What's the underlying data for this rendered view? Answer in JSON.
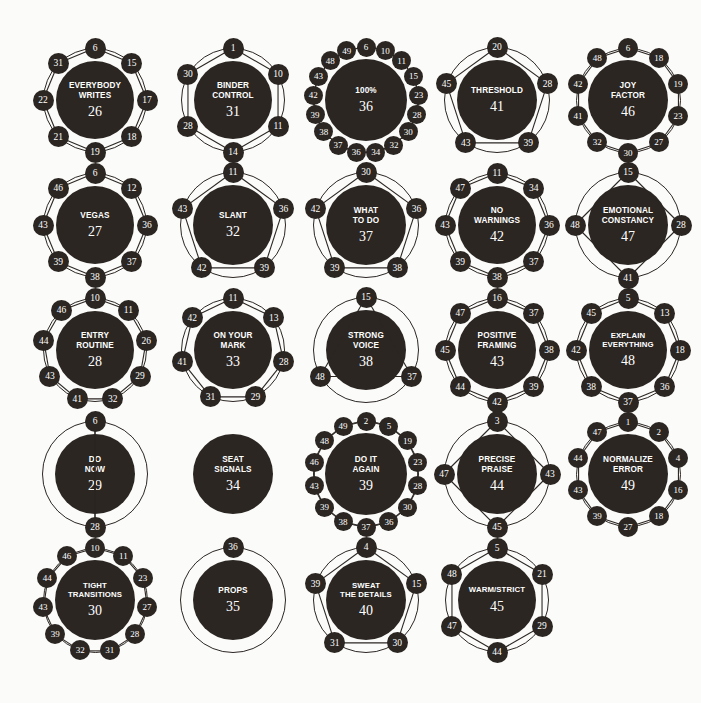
{
  "meta": {
    "hub_color": "#2b2622",
    "text_color": "#ffffff",
    "background_color": "#fbfbfa"
  },
  "chart_data": {
    "type": "diagram",
    "layout": {
      "columns": 5,
      "rows": 5,
      "grid": "left-to-right, top-to-bottom"
    },
    "nodes": [
      {
        "label": "EVERYBODY\nWRITES",
        "number": "26",
        "row": 1,
        "col": 1,
        "satellites": [
          "6",
          "15",
          "17",
          "18",
          "19",
          "21",
          "22",
          "31"
        ]
      },
      {
        "label": "BINDER\nCONTROL",
        "number": "31",
        "row": 1,
        "col": 2,
        "satellites": [
          "1",
          "10",
          "11",
          "14",
          "28",
          "30"
        ]
      },
      {
        "label": "100%",
        "number": "36",
        "row": 1,
        "col": 3,
        "satellites": [
          "6",
          "10",
          "11",
          "15",
          "23",
          "28",
          "30",
          "32",
          "34",
          "36",
          "37",
          "38",
          "39",
          "42",
          "43",
          "48",
          "49"
        ]
      },
      {
        "label": "THRESHOLD",
        "number": "41",
        "row": 1,
        "col": 4,
        "satellites": [
          "20",
          "28",
          "39",
          "43",
          "45"
        ]
      },
      {
        "label": "JOY\nFACTOR",
        "number": "46",
        "row": 1,
        "col": 5,
        "satellites": [
          "6",
          "18",
          "19",
          "23",
          "27",
          "30",
          "32",
          "41",
          "42",
          "48"
        ]
      },
      {
        "label": "VEGAS",
        "number": "27",
        "row": 2,
        "col": 1,
        "satellites": [
          "6",
          "12",
          "36",
          "37",
          "38",
          "39",
          "43",
          "46"
        ]
      },
      {
        "label": "SLANT",
        "number": "32",
        "row": 2,
        "col": 2,
        "satellites": [
          "11",
          "36",
          "39",
          "42",
          "43"
        ]
      },
      {
        "label": "WHAT\nTO DO",
        "number": "37",
        "row": 2,
        "col": 3,
        "satellites": [
          "30",
          "36",
          "38",
          "39",
          "42"
        ]
      },
      {
        "label": "NO\nWARNINGS",
        "number": "42",
        "row": 2,
        "col": 4,
        "satellites": [
          "11",
          "34",
          "36",
          "37",
          "38",
          "39",
          "43",
          "47"
        ]
      },
      {
        "label": "EMOTIONAL\nCONSTANCY",
        "number": "47",
        "row": 2,
        "col": 5,
        "satellites": [
          "15",
          "28",
          "41",
          "48"
        ]
      },
      {
        "label": "ENTRY\nROUTINE",
        "number": "28",
        "row": 3,
        "col": 1,
        "satellites": [
          "10",
          "11",
          "26",
          "29",
          "32",
          "41",
          "43",
          "44",
          "46"
        ]
      },
      {
        "label": "ON YOUR\nMARK",
        "number": "33",
        "row": 3,
        "col": 2,
        "satellites": [
          "11",
          "13",
          "28",
          "29",
          "31",
          "41",
          "42"
        ]
      },
      {
        "label": "STRONG\nVOICE",
        "number": "38",
        "row": 3,
        "col": 3,
        "satellites": [
          "15",
          "37",
          "48"
        ]
      },
      {
        "label": "POSITIVE\nFRAMING",
        "number": "43",
        "row": 3,
        "col": 4,
        "satellites": [
          "16",
          "37",
          "38",
          "39",
          "42",
          "44",
          "45",
          "47"
        ]
      },
      {
        "label": "EXPLAIN\nEVERYTHING",
        "number": "48",
        "row": 3,
        "col": 5,
        "satellites": [
          "5",
          "13",
          "18",
          "36",
          "37",
          "38",
          "42",
          "45"
        ]
      },
      {
        "label": "DO\nNOW",
        "number": "29",
        "row": 4,
        "col": 1,
        "satellites": [
          "6",
          "28"
        ]
      },
      {
        "label": "SEAT\nSIGNALS",
        "number": "34",
        "row": 4,
        "col": 2,
        "satellites": []
      },
      {
        "label": "DO IT\nAGAIN",
        "number": "39",
        "row": 4,
        "col": 3,
        "satellites": [
          "2",
          "5",
          "19",
          "23",
          "28",
          "30",
          "36",
          "37",
          "38",
          "39",
          "43",
          "46",
          "48",
          "49"
        ]
      },
      {
        "label": "PRECISE\nPRAISE",
        "number": "44",
        "row": 4,
        "col": 4,
        "satellites": [
          "3",
          "43",
          "45",
          "47"
        ]
      },
      {
        "label": "NORMALIZE\nERROR",
        "number": "49",
        "row": 4,
        "col": 5,
        "satellites": [
          "1",
          "2",
          "4",
          "16",
          "18",
          "27",
          "39",
          "43",
          "44",
          "47"
        ]
      },
      {
        "label": "TIGHT\nTRANSITIONS",
        "number": "30",
        "row": 5,
        "col": 1,
        "satellites": [
          "10",
          "11",
          "23",
          "27",
          "28",
          "31",
          "32",
          "39",
          "43",
          "44",
          "46"
        ]
      },
      {
        "label": "PROPS",
        "number": "35",
        "row": 5,
        "col": 2,
        "satellites": [
          "36"
        ]
      },
      {
        "label": "SWEAT\nTHE DETAILS",
        "number": "40",
        "row": 5,
        "col": 3,
        "satellites": [
          "4",
          "15",
          "30",
          "31",
          "39"
        ]
      },
      {
        "label": "WARM/STRICT",
        "number": "45",
        "row": 5,
        "col": 4,
        "satellites": [
          "5",
          "21",
          "29",
          "44",
          "47",
          "48"
        ]
      }
    ]
  }
}
